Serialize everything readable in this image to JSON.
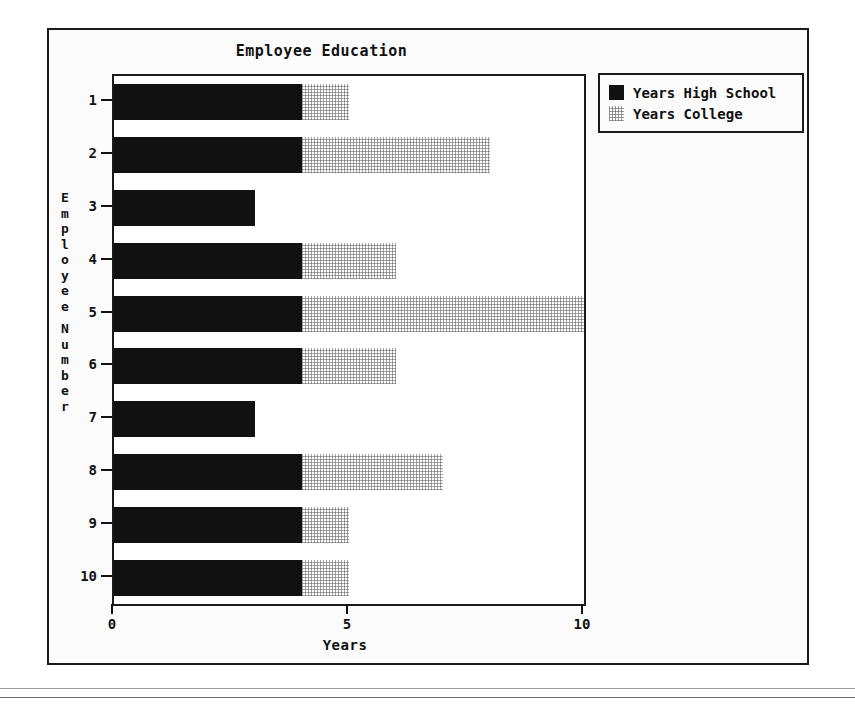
{
  "chart_data": {
    "type": "bar",
    "orientation": "horizontal",
    "stacked": true,
    "title": "Employee Education",
    "xlabel": "Years",
    "ylabel": "Employee Number",
    "xlim": [
      0,
      10
    ],
    "xticks": [
      "0",
      "5",
      "10"
    ],
    "xtick_values": [
      0,
      5,
      10
    ],
    "grid": false,
    "categories": [
      "1",
      "2",
      "3",
      "4",
      "5",
      "6",
      "7",
      "8",
      "9",
      "10"
    ],
    "legend_position": "top-right",
    "series": [
      {
        "name": "Years High School",
        "color": "#111111",
        "values": [
          4,
          4,
          3,
          4,
          4,
          4,
          3,
          4,
          4,
          4
        ]
      },
      {
        "name": "Years College",
        "color": "#e8e8e8",
        "values": [
          1,
          4,
          0,
          2,
          6,
          2,
          0,
          3,
          1,
          1
        ]
      }
    ]
  },
  "legend": {
    "items": [
      {
        "label": "Years High School",
        "swatch": "solid-black-swatch"
      },
      {
        "label": "Years College",
        "swatch": "dotted-light-swatch"
      }
    ]
  },
  "axis": {
    "y_title_letters": [
      "E",
      "m",
      "p",
      "l",
      "o",
      "y",
      "e",
      "e",
      "N",
      "u",
      "m",
      "b",
      "e",
      "r"
    ]
  }
}
